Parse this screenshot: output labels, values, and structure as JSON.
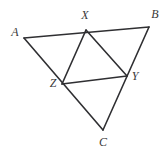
{
  "figure": {
    "width": 167,
    "height": 154,
    "background_color": "#ffffff",
    "stroke_color": "#2f2f32",
    "stroke_width": 1.6,
    "label_color": "#3a3a3a",
    "label_font_size": 12,
    "label_style": "italic-serif"
  },
  "points": {
    "A": {
      "label": "A",
      "x": 24,
      "y": 38,
      "label_x": 15,
      "label_y": 32
    },
    "B": {
      "label": "B",
      "x": 149,
      "y": 27,
      "label_x": 155,
      "label_y": 14
    },
    "C": {
      "label": "C",
      "x": 103,
      "y": 130,
      "label_x": 103,
      "label_y": 142
    },
    "X": {
      "label": "X",
      "x": 86,
      "y": 30,
      "label_x": 85,
      "label_y": 15
    },
    "Y": {
      "label": "Y",
      "x": 127,
      "y": 76,
      "label_x": 135,
      "label_y": 76
    },
    "Z": {
      "label": "Z",
      "x": 62,
      "y": 84,
      "label_x": 53,
      "label_y": 83
    }
  },
  "segments": [
    {
      "name": "side-AB",
      "from": "A",
      "to": "B",
      "x1": 24,
      "y1": 38,
      "x2": 149,
      "y2": 27
    },
    {
      "name": "side-AC",
      "from": "A",
      "to": "C",
      "x1": 24,
      "y1": 38,
      "x2": 103,
      "y2": 130
    },
    {
      "name": "side-BC",
      "from": "B",
      "to": "C",
      "x1": 149,
      "y1": 27,
      "x2": 103,
      "y2": 130
    },
    {
      "name": "midsegment-XZ",
      "from": "X",
      "to": "Z",
      "x1": 86,
      "y1": 30,
      "x2": 62,
      "y2": 84
    },
    {
      "name": "midsegment-XY",
      "from": "X",
      "to": "Y",
      "x1": 86,
      "y1": 30,
      "x2": 127,
      "y2": 76
    },
    {
      "name": "midsegment-ZY",
      "from": "Z",
      "to": "Y",
      "x1": 62,
      "y1": 84,
      "x2": 127,
      "y2": 76
    }
  ]
}
